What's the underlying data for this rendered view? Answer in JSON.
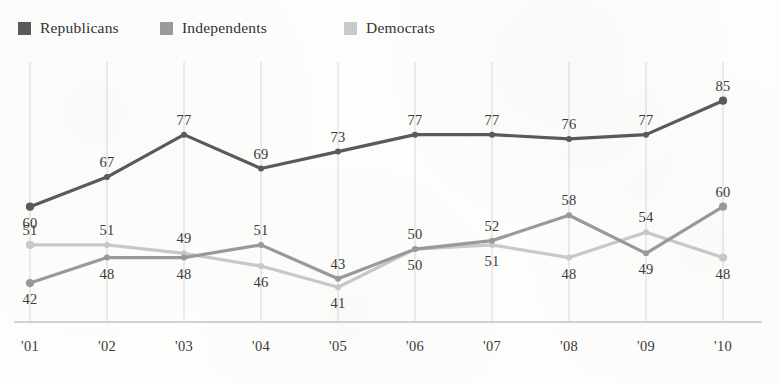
{
  "legend": {
    "position": "top-left",
    "entries": [
      {
        "label": "Republicans",
        "color": "#5a5a5a",
        "swatch_name": "legend-swatch-republicans"
      },
      {
        "label": "Independents",
        "color": "#9a9a9a",
        "swatch_name": "legend-swatch-independents"
      },
      {
        "label": "Democrats",
        "color": "#c9c9c9",
        "swatch_name": "legend-swatch-democrats"
      }
    ]
  },
  "axis": {
    "x_tick_labels": [
      "'01",
      "'02",
      "'03",
      "'04",
      "'05",
      "'06",
      "'07",
      "'08",
      "'09",
      "'10"
    ],
    "y_axis_visible": false,
    "baseline_visible": true,
    "gridlines": "vertical"
  },
  "chart_data": {
    "type": "line",
    "title": "",
    "subtitle": "",
    "xlabel": "",
    "ylabel": "",
    "categories": [
      "'01",
      "'02",
      "'03",
      "'04",
      "'05",
      "'06",
      "'07",
      "'08",
      "'09",
      "'10"
    ],
    "ylim": [
      38,
      88
    ],
    "grid": true,
    "legend_position": "top-left",
    "data_labels": true,
    "series": [
      {
        "name": "Republicans",
        "color": "#5a5a5a",
        "values": [
          60,
          67,
          77,
          69,
          73,
          77,
          77,
          76,
          77,
          85
        ],
        "label_positions": [
          "below",
          "above",
          "above",
          "above",
          "above",
          "above",
          "above",
          "above",
          "above",
          "above"
        ]
      },
      {
        "name": "Independents",
        "color": "#9a9a9a",
        "values": [
          42,
          48,
          48,
          51,
          43,
          50,
          52,
          58,
          49,
          60
        ],
        "label_positions": [
          "below",
          "below",
          "below",
          "above",
          "above",
          "above",
          "above",
          "above",
          "below",
          "above"
        ]
      },
      {
        "name": "Democrats",
        "color": "#c9c9c9",
        "values": [
          51,
          51,
          49,
          46,
          41,
          50,
          51,
          48,
          54,
          48
        ],
        "label_positions": [
          "above",
          "above",
          "above",
          "below",
          "below",
          "below",
          "below",
          "below",
          "above",
          "below"
        ]
      }
    ]
  },
  "colors": {
    "republicans": "#5a5a5a",
    "independents": "#9a9a9a",
    "democrats": "#c9c9c9",
    "gridline": "#d8d8d6",
    "baseline": "#c2c2bf",
    "text": "#3b3a39",
    "background": "#fdfdfc"
  }
}
